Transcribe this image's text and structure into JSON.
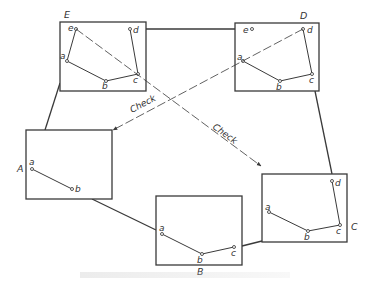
{
  "figure": {
    "stroke_color": "#3a3a3a",
    "point_color": "#444444",
    "boxes": [
      {
        "id": "E",
        "label": "E",
        "x": 60,
        "y": 22,
        "w": 86,
        "h": 69,
        "label_pos": [
          64,
          18
        ],
        "points": [
          {
            "n": "e",
            "x": 76,
            "y": 29,
            "lx": 68,
            "ly": 31
          },
          {
            "n": "d",
            "x": 130,
            "y": 29,
            "lx": 133,
            "ly": 33
          },
          {
            "n": "a",
            "x": 67,
            "y": 61,
            "lx": 60,
            "ly": 59
          },
          {
            "n": "b",
            "x": 106,
            "y": 81,
            "lx": 102,
            "ly": 89
          },
          {
            "n": "c",
            "x": 138,
            "y": 74,
            "lx": 133,
            "ly": 83
          }
        ],
        "polyline": "76,29 67,61 106,81 138,74 130,29"
      },
      {
        "id": "D",
        "label": "D",
        "x": 235,
        "y": 23,
        "w": 84,
        "h": 68,
        "label_pos": [
          300,
          19
        ],
        "points": [
          {
            "n": "e",
            "x": 252,
            "y": 29,
            "lx": 243,
            "ly": 33
          },
          {
            "n": "d",
            "x": 303,
            "y": 29,
            "lx": 307,
            "ly": 33
          },
          {
            "n": "a",
            "x": 243,
            "y": 61,
            "lx": 237,
            "ly": 60
          },
          {
            "n": "b",
            "x": 280,
            "y": 81,
            "lx": 276,
            "ly": 90
          },
          {
            "n": "c",
            "x": 312,
            "y": 74,
            "lx": 309,
            "ly": 83
          }
        ],
        "polyline": "243,61 280,81 312,74 303,29"
      },
      {
        "id": "A",
        "label": "A",
        "x": 26,
        "y": 130,
        "w": 86,
        "h": 69,
        "label_pos": [
          17,
          172
        ],
        "points": [
          {
            "n": "a",
            "x": 32,
            "y": 169,
            "lx": 29,
            "ly": 165
          },
          {
            "n": "b",
            "x": 72,
            "y": 189,
            "lx": 75,
            "ly": 192
          }
        ],
        "polyline": "32,169 72,189"
      },
      {
        "id": "B",
        "label": "B",
        "x": 156,
        "y": 196,
        "w": 86,
        "h": 69,
        "label_pos": [
          197,
          275
        ],
        "points": [
          {
            "n": "a",
            "x": 162,
            "y": 234,
            "lx": 159,
            "ly": 231
          },
          {
            "n": "b",
            "x": 202,
            "y": 254,
            "lx": 197,
            "ly": 263
          },
          {
            "n": "c",
            "x": 234,
            "y": 247,
            "lx": 231,
            "ly": 256
          }
        ],
        "polyline": "162,234 202,254 234,247"
      },
      {
        "id": "C",
        "label": "C",
        "x": 262,
        "y": 174,
        "w": 85,
        "h": 68,
        "label_pos": [
          351,
          230
        ],
        "points": [
          {
            "n": "a",
            "x": 269,
            "y": 212,
            "lx": 265,
            "ly": 210
          },
          {
            "n": "b",
            "x": 308,
            "y": 231,
            "lx": 304,
            "ly": 240
          },
          {
            "n": "c",
            "x": 340,
            "y": 225,
            "lx": 336,
            "ly": 234
          },
          {
            "n": "d",
            "x": 332,
            "y": 181,
            "lx": 335,
            "ly": 186
          }
        ],
        "polyline": "269,212 308,231 340,225 332,181"
      }
    ],
    "connectors": [
      {
        "from": "E",
        "to": "D",
        "x1": 146,
        "y1": 29,
        "x2": 235,
        "y2": 29
      },
      {
        "from": "E",
        "to": "A",
        "x1": 60,
        "y1": 83,
        "x2": 45,
        "y2": 130
      },
      {
        "from": "A",
        "to": "B",
        "x1": 92,
        "y1": 199,
        "x2": 156,
        "y2": 230
      },
      {
        "from": "B",
        "to": "C",
        "x1": 242,
        "y1": 246,
        "x2": 262,
        "y2": 241
      },
      {
        "from": "D",
        "to": "C",
        "x1": 315,
        "y1": 91,
        "x2": 332,
        "y2": 174
      }
    ],
    "checks": [
      {
        "label": "Check",
        "x1": 76,
        "y1": 29,
        "x2": 261,
        "y2": 166,
        "label_x": 212,
        "label_y": 128,
        "rotate": 36
      },
      {
        "label": "Check",
        "x1": 303,
        "y1": 29,
        "x2": 113,
        "y2": 130,
        "label_x": 132,
        "label_y": 113,
        "rotate": -28
      }
    ],
    "caption_legible": false
  }
}
